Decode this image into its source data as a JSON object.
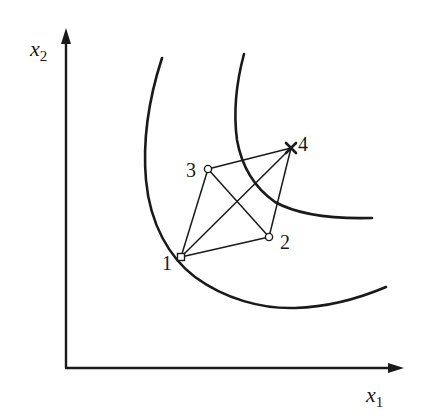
{
  "diagram": {
    "axes": {
      "x_label": "x",
      "x_subscript": "1",
      "y_label": "x",
      "y_subscript": "2"
    },
    "curves": [
      {
        "name": "inner-indifference-curve",
        "description": "lower-left convex curve passing through point 1"
      },
      {
        "name": "outer-indifference-curve",
        "description": "upper-right convex curve passing near point 4"
      }
    ],
    "points": [
      {
        "id": "1",
        "label": "1",
        "marker": "open-square"
      },
      {
        "id": "2",
        "label": "2",
        "marker": "open-circle"
      },
      {
        "id": "3",
        "label": "3",
        "marker": "open-circle"
      },
      {
        "id": "4",
        "label": "4",
        "marker": "cross"
      }
    ],
    "edges": [
      [
        "1",
        "2"
      ],
      [
        "1",
        "3"
      ],
      [
        "1",
        "4"
      ],
      [
        "3",
        "2"
      ],
      [
        "3",
        "4"
      ],
      [
        "2",
        "4"
      ]
    ]
  }
}
